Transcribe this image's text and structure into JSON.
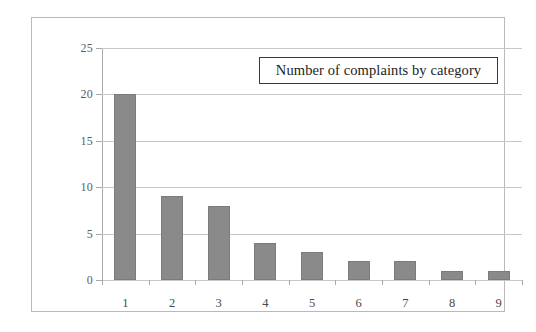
{
  "chart_data": {
    "type": "bar",
    "title": "Number of complaints by category",
    "categories": [
      "1",
      "2",
      "3",
      "4",
      "5",
      "6",
      "7",
      "8",
      "9"
    ],
    "values": [
      20,
      9,
      8,
      4,
      3,
      2,
      2,
      1,
      1
    ],
    "xlabel": "",
    "ylabel": "",
    "ylim": [
      0,
      25
    ],
    "yticks": [
      "0",
      "5",
      "10",
      "15",
      "20",
      "25"
    ],
    "grid": true,
    "legend": "none",
    "bar_color": "#8a8a8a",
    "gridline_color": "#c8c8c8",
    "axis_color": "#a8a8a8",
    "background_color": "#ffffff"
  }
}
